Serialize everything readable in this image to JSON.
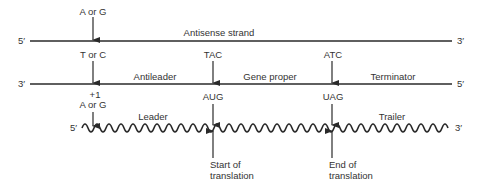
{
  "diagram": {
    "type": "gene-structure",
    "strands": {
      "antisense": {
        "label": "Antisense strand",
        "left_end": "5′",
        "right_end": "3′"
      },
      "sense_dna": {
        "left_end": "3′",
        "right_end": "5′",
        "regions": {
          "antileader": "Antileader",
          "gene_proper": "Gene proper",
          "terminator": "Terminator"
        }
      },
      "mrna": {
        "left_end": "5′",
        "right_end": "3′",
        "regions": {
          "leader": "Leader",
          "trailer": "Trailer"
        }
      }
    },
    "markers": {
      "start_site": {
        "top_base": "A or G",
        "middle_base": "T or C",
        "position": "+1",
        "mrna_base": "A or G"
      },
      "start_codon": {
        "dna_codon": "TAC",
        "mrna_codon": "AUG",
        "note_line1": "Start of",
        "note_line2": "translation"
      },
      "stop_codon": {
        "dna_codon": "ATC",
        "mrna_codon": "UAG",
        "note_line1": "End of",
        "note_line2": "translation"
      }
    },
    "colors": {
      "line": "#2a2a2a",
      "text": "#333333",
      "background": "#ffffff"
    }
  }
}
